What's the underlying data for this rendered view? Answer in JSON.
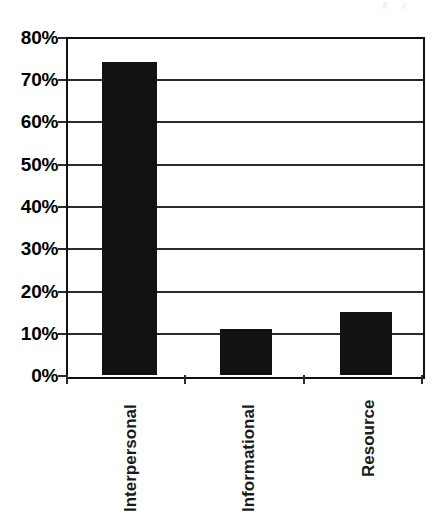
{
  "chart_data": {
    "type": "bar",
    "title": "",
    "subtitle": "",
    "xlabel": "",
    "ylabel": "",
    "categories": [
      "Interpersonal",
      "Informational",
      "Resource"
    ],
    "values": [
      74,
      11,
      15
    ],
    "value_labels": [
      "74%",
      "11%",
      "15%"
    ],
    "ylim": [
      0,
      80
    ],
    "ytick_values": [
      0,
      10,
      20,
      30,
      40,
      50,
      60,
      70,
      80
    ],
    "ytick_labels": [
      "0%",
      "10%",
      "20%",
      "30%",
      "40%",
      "50%",
      "60%",
      "70%",
      "80%"
    ],
    "grid": "horizontal",
    "legend": "none",
    "series": [
      {
        "name": "",
        "values": [
          74,
          11,
          15
        ]
      }
    ],
    "bar_color": "#121212",
    "axis_color": "#111111",
    "gridline_color": "#2b2b2b",
    "background_color": "#ffffff",
    "label_orientation": "vertical-rotated-90"
  },
  "axis": {
    "y_ticks": [
      {
        "label": "80%",
        "value": 80
      },
      {
        "label": "70%",
        "value": 70
      },
      {
        "label": "60%",
        "value": 60
      },
      {
        "label": "50%",
        "value": 50
      },
      {
        "label": "40%",
        "value": 40
      },
      {
        "label": "30%",
        "value": 30
      },
      {
        "label": "20%",
        "value": 20
      },
      {
        "label": "10%",
        "value": 10
      },
      {
        "label": "0%",
        "value": 0
      }
    ],
    "x_categories": [
      {
        "label": "Interpersonal",
        "value": 74
      },
      {
        "label": "Informational",
        "value": 11
      },
      {
        "label": "Resource",
        "value": 15
      }
    ]
  }
}
